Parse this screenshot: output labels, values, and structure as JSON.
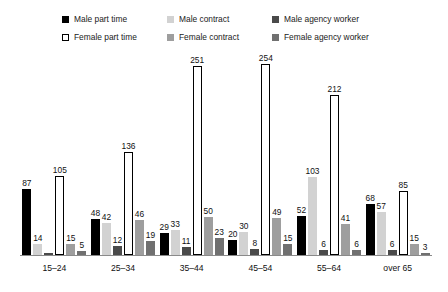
{
  "legend": {
    "items": [
      {
        "label": "Male part time",
        "key": "male_part_time",
        "swatch": "swatch-solid-black",
        "color": "#000000"
      },
      {
        "label": "Male contract",
        "key": "male_contract",
        "swatch": "swatch-light-gray",
        "color": "#d2d2d2"
      },
      {
        "label": "Male agency worker",
        "key": "male_agency_worker",
        "swatch": "swatch-dark-gray",
        "color": "#4a4a4a"
      },
      {
        "label": "Female part time",
        "key": "female_part_time",
        "swatch": "swatch-outline-white",
        "color": "#ffffff"
      },
      {
        "label": "Female contract",
        "key": "female_contract",
        "swatch": "swatch-medium-gray",
        "color": "#9e9e9e"
      },
      {
        "label": "Female agency worker",
        "key": "female_agency_worker",
        "swatch": "swatch-medium-dark-gray",
        "color": "#707070"
      }
    ]
  },
  "chart_data": {
    "type": "bar",
    "title": "",
    "subtitle": "",
    "xlabel": "",
    "ylabel": "",
    "grid": false,
    "legend_position": "top",
    "ylim": [
      0,
      260
    ],
    "categories": [
      "15–24",
      "25–34",
      "35–44",
      "45–54",
      "55–64",
      "over 65"
    ],
    "series": [
      {
        "name": "Male part time",
        "color": "#000000",
        "values": [
          87,
          48,
          29,
          20,
          52,
          68
        ],
        "labels": [
          "87",
          "48",
          "29",
          "20",
          "52",
          "68"
        ]
      },
      {
        "name": "Male contract",
        "color": "#d2d2d2",
        "values": [
          14,
          42,
          33,
          30,
          103,
          57
        ],
        "labels": [
          "14",
          "42",
          "33",
          "30",
          "103",
          "57"
        ]
      },
      {
        "name": "Male agency worker",
        "color": "#4a4a4a",
        "values": [
          3,
          12,
          11,
          8,
          6,
          6
        ],
        "labels": [
          "",
          "12",
          "11",
          "8",
          "6",
          "6"
        ]
      },
      {
        "name": "Female part time",
        "color": "#ffffff",
        "values": [
          105,
          136,
          251,
          254,
          212,
          85
        ],
        "labels": [
          "105",
          "136",
          "251",
          "254",
          "212",
          "85"
        ]
      },
      {
        "name": "Female contract",
        "color": "#9e9e9e",
        "values": [
          15,
          46,
          50,
          49,
          41,
          15
        ],
        "labels": [
          "15",
          "46",
          "50",
          "49",
          "41",
          "15"
        ]
      },
      {
        "name": "Female agency worker",
        "color": "#707070",
        "values": [
          5,
          19,
          23,
          15,
          6,
          3
        ],
        "labels": [
          "5",
          "19",
          "23",
          "15",
          "6",
          "3"
        ]
      }
    ]
  }
}
